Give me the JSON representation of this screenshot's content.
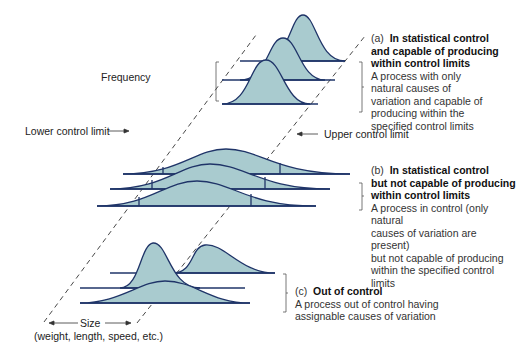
{
  "diagram": {
    "axis_labels": {
      "frequency": "Frequency",
      "size": "Size",
      "size_detail": "(weight, length, speed, etc.)",
      "lower_limit": "Lower control limit",
      "upper_limit": "Upper control limit"
    },
    "panels": [
      {
        "tag": "(a)",
        "title_line1": "In statistical control",
        "title_line2": "and capable of producing",
        "title_line3": "within control limits",
        "desc_lines": [
          "A process with only",
          "natural causes of",
          "variation and capable of",
          "producing within the",
          "specified control limits"
        ]
      },
      {
        "tag": "(b)",
        "title_line1": "In statistical control",
        "title_line2": "but not capable of producing",
        "title_line3": "within control limits",
        "desc_lines": [
          "A process in control (only natural",
          "causes of variation are present)",
          "but not capable of producing",
          "within the specified control",
          "limits"
        ]
      },
      {
        "tag": "(c)",
        "title_line1": "Out of control",
        "desc_lines": [
          "A process out of control having",
          "assignable causes of variation"
        ]
      }
    ],
    "colors": {
      "fill": "#a9cbcf",
      "tail_fill": "#5f8fa3",
      "stroke": "#1f3468",
      "dash": "#333333"
    }
  }
}
